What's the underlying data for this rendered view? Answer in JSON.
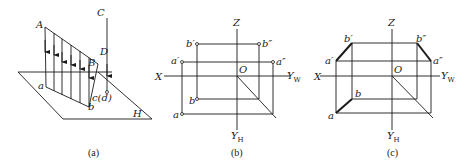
{
  "figure": {
    "panels": [
      {
        "id": "a",
        "caption": "(a)",
        "labels": {
          "A": "A",
          "B": "B",
          "C": "C",
          "D": "D",
          "a": "a",
          "b": "b",
          "cd": "c(d)",
          "H": "H"
        }
      },
      {
        "id": "b",
        "caption": "(b)",
        "labels": {
          "Z": "Z",
          "X": "X",
          "O": "O",
          "YW": "Y",
          "YW_sub": "W",
          "YH": "Y",
          "YH_sub": "H",
          "b_prime": "b′",
          "b_dprime": "b″",
          "a_prime": "a′",
          "a_dprime": "a″",
          "b": "b",
          "a": "a"
        }
      },
      {
        "id": "c",
        "caption": "(c)",
        "labels": {
          "Z": "Z",
          "X": "X",
          "O": "O",
          "YW": "Y",
          "YW_sub": "W",
          "YH": "Y",
          "YH_sub": "H",
          "b_prime": "b′",
          "b_dprime": "b″",
          "a_prime": "a′",
          "a_dprime": "a″",
          "b": "b",
          "a": "a"
        }
      }
    ],
    "colors": {
      "ink": "#1a1a1a",
      "background": "#ffffff"
    }
  }
}
